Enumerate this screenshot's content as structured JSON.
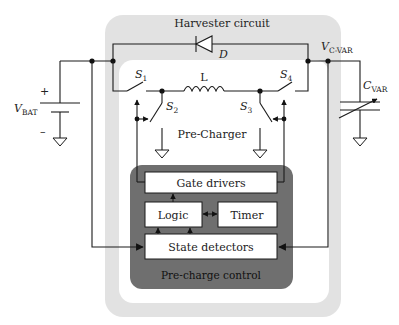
{
  "diagram": {
    "title": "Harvester circuit",
    "colors": {
      "harvester_bg": "#e2e2e2",
      "inner_bg": "#ffffff",
      "control_bg": "#6f6f6f",
      "block_bg": "#ffffff",
      "wire": "#1a1a1a"
    },
    "regions": {
      "harvester": "Harvester circuit",
      "precharger": "Pre-Charger",
      "control": "Pre-charge control"
    },
    "components": {
      "diode": "D",
      "inductor": "L",
      "battery": {
        "symbol": "V",
        "subscript": "BAT",
        "plus": "+",
        "minus": "–"
      },
      "node_cvar": {
        "symbol": "V",
        "subscript": "C-VAR"
      },
      "capacitor": {
        "symbol": "C",
        "subscript": "VAR"
      },
      "switches": [
        {
          "symbol": "S",
          "subscript": "1"
        },
        {
          "symbol": "S",
          "subscript": "2"
        },
        {
          "symbol": "S",
          "subscript": "3"
        },
        {
          "symbol": "S",
          "subscript": "4"
        }
      ]
    },
    "blocks": {
      "gate_drivers": "Gate drivers",
      "logic": "Logic",
      "timer": "Timer",
      "state_detectors": "State detectors"
    }
  }
}
